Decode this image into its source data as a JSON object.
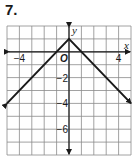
{
  "problem": {
    "number": "7."
  },
  "chart_data": {
    "type": "line",
    "title": "",
    "xlabel": "x",
    "ylabel": "y",
    "origin_label": "O",
    "xlim": [
      -5,
      5
    ],
    "ylim": [
      -8,
      2
    ],
    "grid": true,
    "x_tick_labels": [
      {
        "value": -4,
        "label": "−4"
      },
      {
        "value": 4,
        "label": "4"
      }
    ],
    "y_tick_labels": [
      {
        "value": -2,
        "label": "−2"
      },
      {
        "value": -4,
        "label": "−4"
      },
      {
        "value": -6,
        "label": "−6"
      }
    ],
    "series": [
      {
        "name": "graph",
        "points": [
          [
            -5,
            -4
          ],
          [
            0,
            1
          ],
          [
            5,
            -4
          ]
        ],
        "arrows_at_ends": true
      }
    ],
    "colors": {
      "line": "#1a1a1a",
      "grid": "#8a8a8a",
      "axis": "#1a1a1a"
    }
  }
}
